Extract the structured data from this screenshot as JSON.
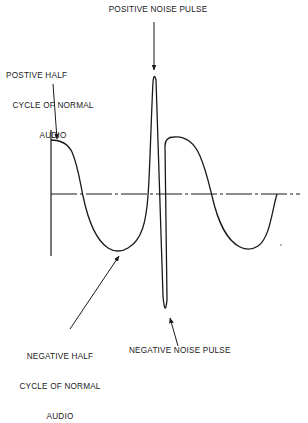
{
  "diagram": {
    "type": "waveform",
    "labels": {
      "positive_noise_pulse": "POSITIVE NOISE PULSE",
      "positive_half_cycle": [
        "POSTIVE HALF",
        "CYCLE OF NORMAL",
        "AUDIO"
      ],
      "negative_half_cycle": [
        "NEGATIVE HALF",
        "CYCLE OF NORMAL",
        "AUDIO"
      ],
      "negative_noise_pulse": "NEGATIVE NOISE PULSE"
    },
    "colors": {
      "ink": "#1a1a1a",
      "background": "#ffffff"
    }
  }
}
